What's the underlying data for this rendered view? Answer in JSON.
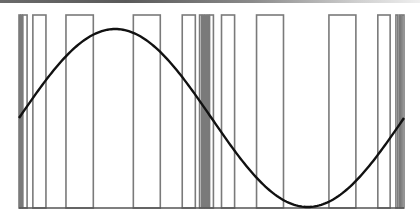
{
  "chart_data": {
    "type": "line",
    "title": "",
    "xlabel": "",
    "ylabel": "",
    "x_range": [
      0,
      1
    ],
    "y_range": [
      -1,
      1
    ],
    "grid": false,
    "legend": "none",
    "series": [
      {
        "name": "sine",
        "color": "#111111",
        "function": "sin(2*pi*x)",
        "x": [
          0,
          0.125,
          0.25,
          0.375,
          0.5,
          0.625,
          0.75,
          0.875,
          1
        ],
        "values": [
          0,
          0.707,
          1,
          0.707,
          0,
          -0.707,
          -1,
          -0.707,
          0
        ]
      }
    ],
    "pulses": {
      "color": "#7a7a7a",
      "level": 1,
      "intervals": [
        [
          0.0,
          0.003
        ],
        [
          0.005,
          0.008
        ],
        [
          0.01,
          0.021
        ],
        [
          0.036,
          0.07
        ],
        [
          0.122,
          0.193
        ],
        [
          0.297,
          0.367
        ],
        [
          0.424,
          0.458
        ],
        [
          0.469,
          0.474
        ],
        [
          0.477,
          0.481
        ],
        [
          0.484,
          0.487
        ],
        [
          0.49,
          0.493
        ],
        [
          0.495,
          0.505
        ],
        [
          0.526,
          0.56
        ],
        [
          0.617,
          0.687
        ],
        [
          0.805,
          0.875
        ],
        [
          0.932,
          0.964
        ],
        [
          0.979,
          0.984
        ],
        [
          0.988,
          0.992
        ],
        [
          0.995,
          1.0
        ]
      ]
    }
  }
}
